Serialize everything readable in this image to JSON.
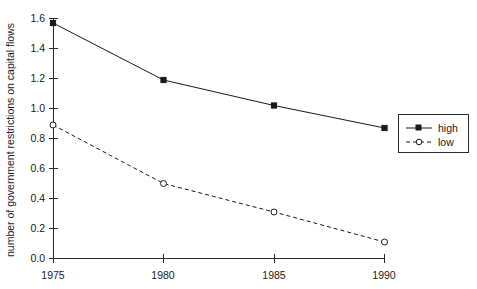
{
  "chart_data": {
    "type": "line",
    "title": "",
    "xlabel": "",
    "ylabel": "number of government restrictions on capital flows",
    "x": [
      1975,
      1980,
      1985,
      1990
    ],
    "categories": [
      "1975",
      "1980",
      "1985",
      "1990"
    ],
    "xlim": [
      1975,
      1990
    ],
    "ylim": [
      0.0,
      1.6
    ],
    "yticks": [
      "0.0",
      "0.2",
      "0.4",
      "0.6",
      "0.8",
      "1.0",
      "1.2",
      "1.4",
      "1.6"
    ],
    "ytick_values": [
      0.0,
      0.2,
      0.4,
      0.6,
      0.8,
      1.0,
      1.2,
      1.4,
      1.6
    ],
    "xticks": [
      "1975",
      "1980",
      "1985",
      "1990"
    ],
    "grid": false,
    "legend_position": "right",
    "series": [
      {
        "name": "high",
        "values": [
          1.57,
          1.19,
          1.02,
          0.87
        ],
        "line_style": "solid",
        "marker": "filled-square",
        "color": "#1a1a1a"
      },
      {
        "name": "low",
        "values": [
          0.89,
          0.5,
          0.31,
          0.11
        ],
        "line_style": "dashed",
        "marker": "open-circle",
        "color": "#1a1a1a"
      }
    ]
  },
  "legend": {
    "entries": [
      {
        "label": "high"
      },
      {
        "label": "low"
      }
    ]
  },
  "axes": {
    "y_title": "number of government restrictions on capital flows",
    "y_tick_labels": [
      "1.6",
      "1.4",
      "1.2",
      "1.0",
      "0.8",
      "0.6",
      "0.4",
      "0.2",
      "0.0"
    ],
    "x_tick_labels": [
      "1975",
      "1980",
      "1985",
      "1990"
    ]
  }
}
